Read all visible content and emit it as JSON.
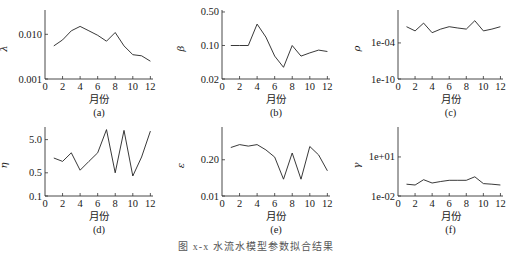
{
  "figure": {
    "caption": "图 x-x 水流水模型参数拟合结果",
    "xlabel": "月份"
  },
  "chart_data": [
    {
      "panel": "(a)",
      "type": "line",
      "ylabel": "λ",
      "yscale": "log",
      "x": [
        1,
        2,
        3,
        4,
        5,
        6,
        7,
        8,
        9,
        10,
        11,
        12
      ],
      "values": [
        0.0055,
        0.0075,
        0.012,
        0.015,
        0.012,
        0.0095,
        0.007,
        0.011,
        0.0055,
        0.0035,
        0.0033,
        0.0025
      ],
      "yticks": [
        0.001,
        0.01
      ],
      "ytick_labels": [
        "0.001",
        "0.010"
      ],
      "ylim": [
        0.001,
        0.035
      ],
      "xticks": [
        0,
        2,
        4,
        6,
        8,
        10,
        12
      ],
      "xlim": [
        0,
        12.3
      ],
      "xlabel": "月份"
    },
    {
      "panel": "(b)",
      "type": "line",
      "ylabel": "β",
      "yscale": "log",
      "x": [
        1,
        2,
        3,
        4,
        5,
        6,
        7,
        8,
        9,
        10,
        11,
        12
      ],
      "values": [
        0.1,
        0.1,
        0.1,
        0.28,
        0.15,
        0.06,
        0.035,
        0.1,
        0.06,
        0.07,
        0.08,
        0.075
      ],
      "yticks": [
        0.02,
        0.1,
        0.5
      ],
      "ytick_labels": [
        "0.02",
        "0.10",
        "0.50"
      ],
      "ylim": [
        0.02,
        0.55
      ],
      "xticks": [
        0,
        2,
        4,
        6,
        8,
        10,
        12
      ],
      "xlim": [
        0,
        12.3
      ],
      "xlabel": "月份"
    },
    {
      "panel": "(c)",
      "type": "line",
      "ylabel": "ρ",
      "yscale": "log",
      "x": [
        1,
        2,
        3,
        4,
        5,
        6,
        7,
        8,
        9,
        10,
        11,
        12
      ],
      "values": [
        0.05,
        0.01,
        0.2,
        0.005,
        0.02,
        0.05,
        0.03,
        0.02,
        0.5,
        0.01,
        0.02,
        0.05
      ],
      "yticks": [
        1e-10,
        0.0001
      ],
      "ytick_labels": [
        "1e-10",
        "1e-04"
      ],
      "ylim": [
        1e-10,
        30
      ],
      "xticks": [
        0,
        2,
        4,
        6,
        8,
        10,
        12
      ],
      "xlim": [
        0,
        12.3
      ],
      "xlabel": "月份"
    },
    {
      "panel": "(d)",
      "type": "line",
      "ylabel": "η",
      "yscale": "log",
      "x": [
        1,
        2,
        3,
        4,
        5,
        6,
        7,
        8,
        9,
        10,
        11,
        12
      ],
      "values": [
        1.4,
        1.1,
        2.0,
        0.6,
        1.1,
        2.0,
        10,
        0.5,
        9.5,
        0.4,
        1.5,
        9.0
      ],
      "yticks": [
        0.1,
        0.5,
        5.0
      ],
      "ytick_labels": [
        "0.1",
        "0.5",
        "5.0"
      ],
      "ylim": [
        0.1,
        12
      ],
      "xticks": [
        0,
        2,
        4,
        6,
        8,
        10,
        12
      ],
      "xlim": [
        0,
        12.3
      ],
      "xlabel": "月份"
    },
    {
      "panel": "(e)",
      "type": "line",
      "ylabel": "ε",
      "yscale": "log",
      "x": [
        1,
        2,
        3,
        4,
        5,
        6,
        7,
        8,
        9,
        10,
        11,
        12
      ],
      "values": [
        0.55,
        0.7,
        0.62,
        0.7,
        0.45,
        0.25,
        0.04,
        0.35,
        0.04,
        0.6,
        0.3,
        0.08
      ],
      "yticks": [
        0.01,
        0.2
      ],
      "ytick_labels": [
        "0.01",
        "0.20"
      ],
      "ylim": [
        0.01,
        3.0
      ],
      "xticks": [
        0,
        2,
        4,
        6,
        8,
        10,
        12
      ],
      "xlim": [
        0,
        12.3
      ],
      "xlabel": "月份"
    },
    {
      "panel": "(f)",
      "type": "line",
      "ylabel": "γ",
      "yscale": "log",
      "x": [
        1,
        2,
        3,
        4,
        5,
        6,
        7,
        8,
        9,
        10,
        11,
        12
      ],
      "values": [
        0.08,
        0.07,
        0.18,
        0.1,
        0.13,
        0.16,
        0.16,
        0.16,
        0.3,
        0.09,
        0.08,
        0.07
      ],
      "yticks": [
        0.01,
        10
      ],
      "ytick_labels": [
        "1e-02",
        "1e+01"
      ],
      "ylim": [
        0.01,
        2000
      ],
      "xticks": [
        0,
        2,
        4,
        6,
        8,
        10,
        12
      ],
      "xlim": [
        0,
        12.3
      ],
      "xlabel": "月份"
    }
  ]
}
